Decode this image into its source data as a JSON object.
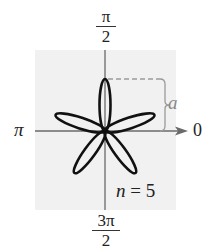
{
  "figure": {
    "type": "polar-rose-curve",
    "angle_labels": {
      "top": {
        "numerator": "π",
        "denominator": "2"
      },
      "left": "π",
      "right": "0",
      "bottom": {
        "numerator": "3π",
        "denominator": "2"
      }
    },
    "dimension_label": "a",
    "caption": {
      "variable": "n",
      "equals": " = ",
      "value": "5"
    },
    "petals": 5,
    "colors": {
      "curve": "#111111",
      "axes": "#666666",
      "panel": "#f1f1f1",
      "dashed_guide": "#999999"
    }
  }
}
